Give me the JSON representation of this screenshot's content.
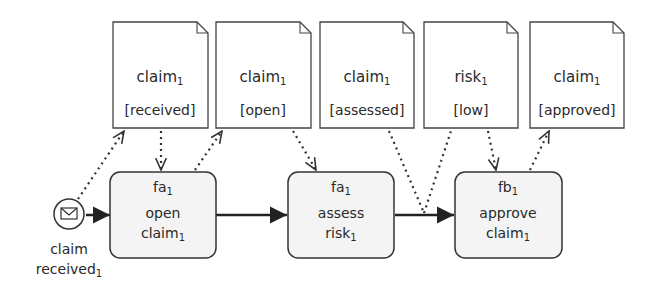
{
  "diagram": {
    "colors": {
      "stroke": "#3a3a3a",
      "task_fill": "#f4f4f4",
      "doc_fill": "#ffffff",
      "text": "#2a2a2a"
    },
    "data_objects": [
      {
        "name": "claim",
        "sub": "1",
        "state": "[received]"
      },
      {
        "name": "claim",
        "sub": "1",
        "state": "[open]"
      },
      {
        "name": "claim",
        "sub": "1",
        "state": "[assessed]"
      },
      {
        "name": "risk",
        "sub": "1",
        "state": "[low]"
      },
      {
        "name": "claim",
        "sub": "1",
        "state": "[approved]"
      }
    ],
    "start_event": {
      "label_line1": "claim",
      "label_line2": "received",
      "sub": "1",
      "icon": "envelope-icon"
    },
    "tasks": [
      {
        "role": "fa",
        "role_sub": "1",
        "line1": "open",
        "line2": "claim",
        "line2_sub": "1"
      },
      {
        "role": "fa",
        "role_sub": "1",
        "line1": "assess",
        "line2": "risk",
        "line2_sub": "1"
      },
      {
        "role": "fb",
        "role_sub": "1",
        "line1": "approve",
        "line2": "claim",
        "line2_sub": "1"
      }
    ]
  }
}
